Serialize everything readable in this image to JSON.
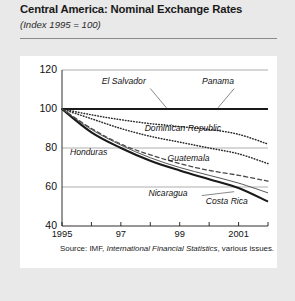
{
  "header": {
    "title": "Central America: Nominal Exchange Rates",
    "subtitle": "(Index 1995 = 100)"
  },
  "source_note": {
    "prefix": "Source: IMF,",
    "italic": "International Financial Statistics",
    "suffix": ", various issues."
  },
  "chart_data": {
    "type": "line",
    "title": "Central America: Nominal Exchange Rates",
    "subtitle": "(Index 1995 = 100)",
    "xlabel": "",
    "ylabel": "",
    "xlim": [
      1995,
      2002
    ],
    "ylim": [
      40,
      120
    ],
    "yticks": [
      40,
      60,
      80,
      100,
      120
    ],
    "ytick_labels": [
      "40",
      "60",
      "80",
      "100",
      "120"
    ],
    "xticks": [
      1995,
      1996,
      1997,
      1998,
      1999,
      2000,
      2001,
      2002
    ],
    "xtick_labels": [
      "1995",
      "",
      "97",
      "",
      "99",
      "",
      "2001",
      ""
    ],
    "grid": "horizontal",
    "legend": "inline-labels",
    "x": [
      1995,
      1996,
      1997,
      1998,
      1999,
      2000,
      2001,
      2002
    ],
    "series": [
      {
        "name": "Panama",
        "style": "solid-thick",
        "color": "#1a1a1a",
        "values": [
          100,
          100,
          100,
          100,
          100,
          100,
          100,
          100
        ],
        "label_x": 2000.3,
        "label_y": 114
      },
      {
        "name": "El Salvador",
        "style": "solid-thick",
        "color": "#1a1a1a",
        "values": [
          100,
          100,
          100,
          100,
          100,
          100,
          100,
          100
        ],
        "label_x": 1997.1,
        "label_y": 114
      },
      {
        "name": "Dominican Republic",
        "style": "dotted",
        "color": "#2b2b2b",
        "values": [
          100,
          97,
          94.5,
          92.5,
          91,
          89.5,
          87,
          82
        ],
        "label_x": 1999.1,
        "label_y": 89.5
      },
      {
        "name": "Guatemala",
        "style": "dotted",
        "color": "#2b2b2b",
        "values": [
          100,
          95,
          90,
          86,
          83,
          80,
          77,
          72
        ],
        "label_x": 1999.3,
        "label_y": 74.5
      },
      {
        "name": "Honduras",
        "style": "dashed",
        "color": "#4a4a4a",
        "values": [
          100,
          90,
          82,
          76.5,
          72,
          68.5,
          66,
          63
        ],
        "label_x": 1995.9,
        "label_y": 77.5
      },
      {
        "name": "Nicaragua",
        "style": "solid-thick",
        "color": "#1a1a1a",
        "values": [
          100,
          88,
          80,
          73.5,
          68.5,
          64,
          59.5,
          52.5
        ],
        "label_x": 1998.6,
        "label_y": 56.5
      },
      {
        "name": "Costa Rica",
        "style": "solid-thin",
        "color": "#555555",
        "values": [
          100,
          89.5,
          81.5,
          75,
          70,
          66,
          62,
          57
        ],
        "label_x": 2000.6,
        "label_y": 52.5
      }
    ]
  }
}
